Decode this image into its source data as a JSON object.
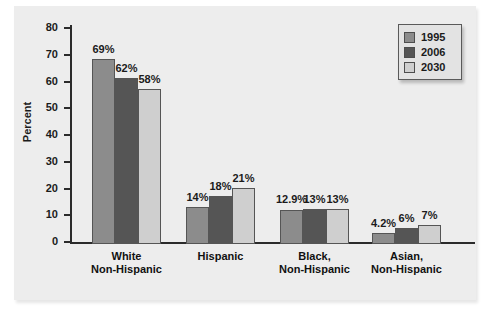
{
  "chart_data": {
    "type": "bar",
    "title": "",
    "xlabel": "",
    "ylabel": "Percent",
    "ylim": [
      0,
      80
    ],
    "ytick_step": 10,
    "yticks": [
      "80",
      "70",
      "60",
      "50",
      "40",
      "30",
      "20",
      "10",
      "0"
    ],
    "grid": false,
    "legend_position": "top-right",
    "categories": [
      "White\nNon-Hispanic",
      "Hispanic",
      "Black,\nNon-Hispanic",
      "Asian,\nNon-Hispanic"
    ],
    "category_lines": [
      [
        "White",
        "Non-Hispanic"
      ],
      [
        "Hispanic",
        ""
      ],
      [
        "Black,",
        "Non-Hispanic"
      ],
      [
        "Asian,",
        "Non-Hispanic"
      ]
    ],
    "series": [
      {
        "name": "1995",
        "color": "#8c8c8c",
        "values": [
          69,
          14,
          12.9,
          4.2
        ],
        "labels": [
          "69%",
          "14%",
          "12.9%",
          "4.2%"
        ]
      },
      {
        "name": "2006",
        "color": "#555555",
        "values": [
          62,
          18,
          13,
          6
        ],
        "labels": [
          "62%",
          "18%",
          "13%",
          "6%"
        ]
      },
      {
        "name": "2030",
        "color": "#cfcfcf",
        "values": [
          58,
          21,
          13,
          7
        ],
        "labels": [
          "58%",
          "21%",
          "13%",
          "7%"
        ]
      }
    ]
  },
  "legend": {
    "entries": [
      {
        "label": "1995",
        "color": "#8c8c8c"
      },
      {
        "label": "2006",
        "color": "#555555"
      },
      {
        "label": "2030",
        "color": "#cfcfcf"
      }
    ]
  },
  "axis": {
    "y_title": "Percent"
  }
}
